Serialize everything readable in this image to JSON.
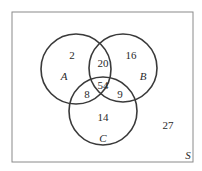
{
  "diagram": {
    "type": "venn",
    "universe_label": "S",
    "sets": [
      {
        "name": "A",
        "only": "2"
      },
      {
        "name": "B",
        "only": "16"
      },
      {
        "name": "C",
        "only": "14"
      }
    ],
    "regions": {
      "a_only": "2",
      "b_only": "16",
      "c_only": "14",
      "a_b_only": "20",
      "a_c_only": "8",
      "b_c_only": "9",
      "a_b_c": "54",
      "outside": "27"
    },
    "colors": {
      "stroke": "#3a3a3a",
      "frame": "#8a8a8a",
      "text": "#2a2a2a"
    }
  }
}
